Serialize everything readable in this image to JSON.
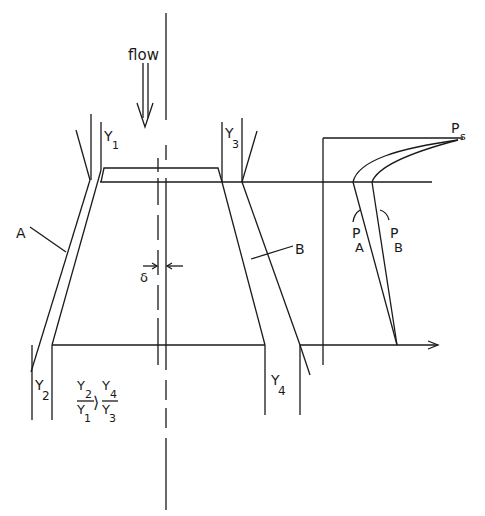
{
  "diagram": {
    "flow_label": "flow",
    "labels": {
      "Y1": {
        "main": "Y",
        "sub": "1"
      },
      "Y2": {
        "main": "Y",
        "sub": "2"
      },
      "Y3": {
        "main": "Y",
        "sub": "3"
      },
      "Y4": {
        "main": "Y",
        "sub": "4"
      },
      "A": "A",
      "B": "B",
      "delta": "δ",
      "PA": {
        "main": "P",
        "sub": "A"
      },
      "PB": {
        "main": "P",
        "sub": "B"
      },
      "Ps": {
        "main": "P",
        "sub": "s"
      }
    },
    "inequality": {
      "left_num": "Y",
      "left_num_sub": "2",
      "left_den": "Y",
      "left_den_sub": "1",
      "operator": "⟩",
      "right_num": "Y",
      "right_num_sub": "4",
      "right_den": "Y",
      "right_den_sub": "3"
    }
  }
}
